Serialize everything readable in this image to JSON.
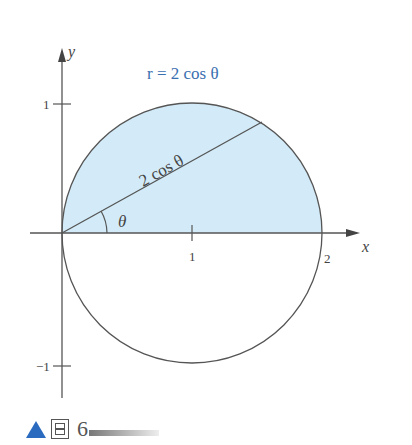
{
  "figure": {
    "curve_label": "r = 2 cos θ",
    "chord_label": "2 cos θ",
    "angle_label": "θ",
    "x_axis_label": "x",
    "y_axis_label": "y",
    "x_ticks": [
      "1",
      "2"
    ],
    "y_ticks": [
      "1",
      "−1"
    ],
    "colors": {
      "fill": "#d3ebf8",
      "curve_label": "#3a6fb0",
      "stroke": "#555555"
    }
  },
  "caption": {
    "marker": "▲",
    "label_glyph": "图",
    "number": "6"
  }
}
